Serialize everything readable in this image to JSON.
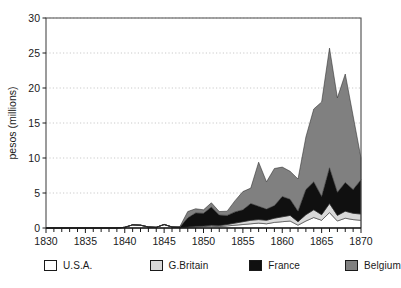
{
  "chart_data": {
    "type": "area",
    "stacked": true,
    "title": "",
    "xlabel": "",
    "ylabel": "pesos (millions)",
    "xlim": [
      1830,
      1870
    ],
    "ylim": [
      0,
      30
    ],
    "grid": true,
    "grid_style": "dotted-horizontal",
    "legend_position": "bottom",
    "x_tick_labels": [
      "1830",
      "1835",
      "1840",
      "1845",
      "1850",
      "1855",
      "1860",
      "1865",
      "1870"
    ],
    "x_tick_values": [
      1830,
      1835,
      1840,
      1845,
      1850,
      1855,
      1860,
      1865,
      1870
    ],
    "x_minor_tick_interval": 1,
    "y_tick_labels": [
      "0",
      "5",
      "10",
      "15",
      "20",
      "25",
      "30"
    ],
    "y_tick_values": [
      0,
      5,
      10,
      15,
      20,
      25,
      30
    ],
    "x": [
      1830,
      1831,
      1832,
      1833,
      1834,
      1835,
      1836,
      1837,
      1838,
      1839,
      1840,
      1841,
      1842,
      1843,
      1844,
      1845,
      1846,
      1847,
      1848,
      1849,
      1850,
      1851,
      1852,
      1853,
      1854,
      1855,
      1856,
      1857,
      1858,
      1859,
      1860,
      1861,
      1862,
      1863,
      1864,
      1865,
      1866,
      1867,
      1868,
      1869,
      1870
    ],
    "series": [
      {
        "name": "U.S.A.",
        "color": "#ffffff",
        "values": [
          0,
          0,
          0,
          0,
          0,
          0,
          0,
          0,
          0,
          0,
          0.1,
          0.45,
          0.4,
          0.15,
          0.1,
          0.5,
          0.15,
          0.05,
          0.1,
          0.15,
          0.2,
          0.25,
          0.2,
          0.3,
          0.4,
          0.5,
          0.6,
          0.7,
          0.6,
          0.8,
          0.9,
          1.0,
          0.4,
          1.0,
          1.5,
          1.1,
          2.2,
          1.0,
          1.4,
          1.2,
          1.1
        ]
      },
      {
        "name": "G.Britain",
        "color": "#d9d9d9",
        "values": [
          0,
          0,
          0,
          0,
          0,
          0,
          0,
          0,
          0,
          0,
          0,
          0,
          0,
          0,
          0,
          0,
          0,
          0,
          0.05,
          0.1,
          0.1,
          0.15,
          0.15,
          0.2,
          0.3,
          0.4,
          0.5,
          0.5,
          0.5,
          0.6,
          0.7,
          0.8,
          0.5,
          0.9,
          1.1,
          0.8,
          1.3,
          0.8,
          1.0,
          0.9,
          0.9
        ]
      },
      {
        "name": "France",
        "color": "#101010",
        "values": [
          0,
          0,
          0,
          0,
          0,
          0,
          0,
          0,
          0,
          0,
          0,
          0,
          0,
          0,
          0,
          0,
          0,
          0.1,
          1.3,
          1.9,
          1.8,
          2.6,
          1.5,
          1.3,
          1.6,
          1.7,
          2.4,
          1.9,
          1.6,
          1.8,
          2.9,
          2.3,
          1.5,
          3.6,
          4.0,
          2.6,
          5.1,
          3.3,
          4.1,
          3.4,
          4.9
        ]
      },
      {
        "name": "Belgium",
        "color": "#808080",
        "values": [
          0,
          0,
          0,
          0,
          0,
          0,
          0,
          0,
          0,
          0,
          0,
          0,
          0,
          0,
          0,
          0,
          0,
          0.05,
          0.9,
          0.6,
          0.5,
          0.6,
          0.5,
          0.6,
          1.6,
          2.6,
          2.2,
          6.3,
          3.9,
          5.3,
          4.2,
          4.0,
          4.6,
          7.5,
          10.4,
          13.5,
          17.1,
          13.5,
          15.5,
          10.5,
          3.1
        ]
      }
    ],
    "totals": [
      0,
      0,
      0,
      0,
      0,
      0,
      0,
      0,
      0,
      0,
      0.1,
      0.45,
      0.4,
      0.15,
      0.1,
      0.5,
      0.15,
      0.2,
      2.35,
      2.75,
      2.6,
      3.6,
      2.35,
      2.4,
      3.9,
      5.2,
      5.7,
      9.4,
      6.6,
      8.5,
      8.7,
      8.1,
      7.0,
      13.0,
      17.0,
      18.0,
      25.7,
      18.6,
      22.0,
      16.0,
      10.0
    ]
  },
  "legend": {
    "items": [
      {
        "label": "U.S.A.",
        "color": "#ffffff"
      },
      {
        "label": "G.Britain",
        "color": "#d9d9d9"
      },
      {
        "label": "France",
        "color": "#101010"
      },
      {
        "label": "Belgium",
        "color": "#808080"
      }
    ]
  }
}
